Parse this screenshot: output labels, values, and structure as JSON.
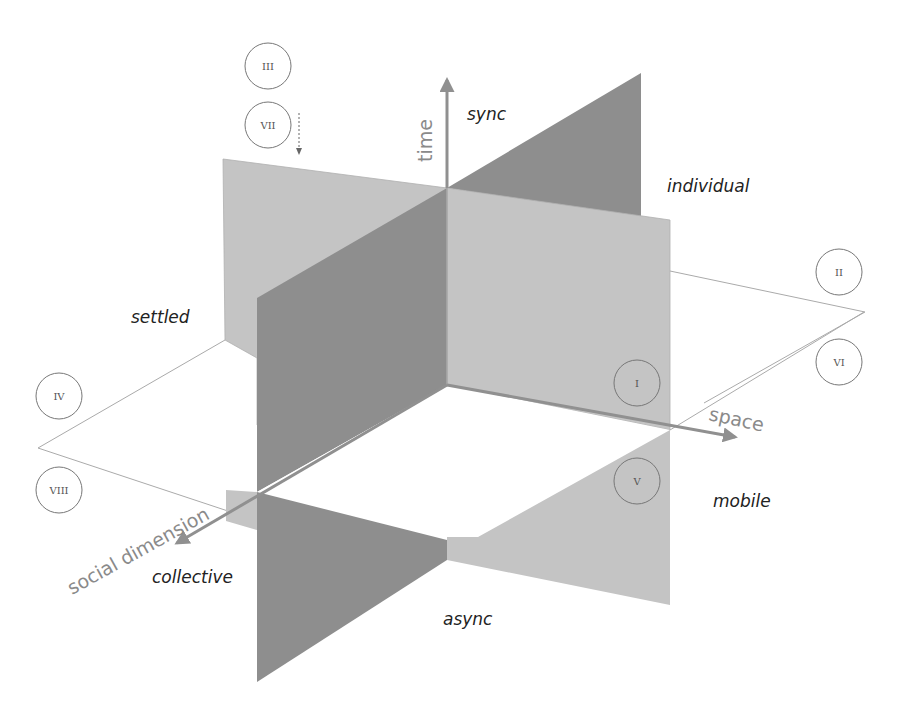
{
  "diagram": {
    "type": "3d-planes-octants",
    "axes": {
      "time": {
        "label": "time",
        "positive_end": "sync",
        "negative_end": "async"
      },
      "space": {
        "label": "space",
        "positive_end": "mobile",
        "negative_end": "settled"
      },
      "social": {
        "label": "social dimension",
        "positive_end": "collective",
        "negative_end": "individual"
      }
    },
    "pole_labels": {
      "sync": "sync",
      "async": "async",
      "individual": "individual",
      "collective": "collective",
      "settled": "settled",
      "mobile": "mobile"
    },
    "octants": [
      {
        "id": "I",
        "label": "I"
      },
      {
        "id": "II",
        "label": "II"
      },
      {
        "id": "III",
        "label": "III"
      },
      {
        "id": "IV",
        "label": "IV"
      },
      {
        "id": "V",
        "label": "V"
      },
      {
        "id": "VI",
        "label": "VI"
      },
      {
        "id": "VII",
        "label": "VII"
      },
      {
        "id": "VIII",
        "label": "VIII"
      }
    ],
    "colors": {
      "background": "#ffffff",
      "light_plane": "#c4c4c4",
      "dark_plane": "#8e8e8e",
      "axis_arrow": "#909090",
      "text": "#222222",
      "axis_text": "#8a8a8a",
      "outline": "#9a9a9a"
    }
  }
}
